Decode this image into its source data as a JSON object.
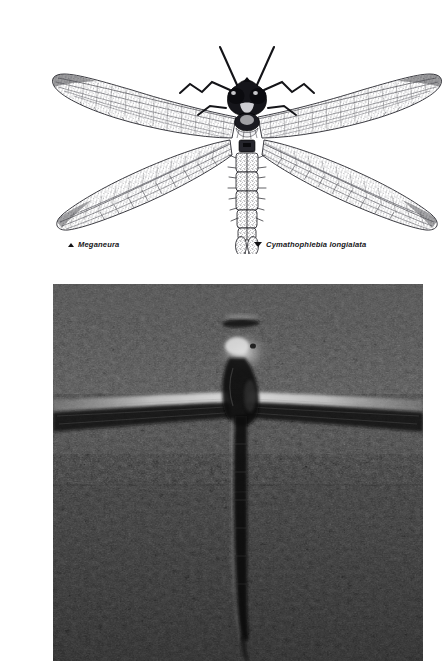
{
  "page": {
    "background_color": "#ffffff",
    "width": 413,
    "height": 662
  },
  "illustration": {
    "name": "giant-dragonfly-engraving",
    "subject": "Meganeura giant dragonfly, dorsal view, wings spread",
    "style": "black and white line engraving / stipple drawing",
    "ink_color": "#1a1a1a",
    "paper_color": "#ffffff",
    "alt": "Engraving of an extinct giant dragonfly seen from above with four long spread wings, large compound eyes, antennae and a segmented abdomen"
  },
  "captions": [
    {
      "marker": "triangle-up-icon",
      "marker_glyph": "▲",
      "text": "Meganeura"
    },
    {
      "marker": "triangle-down-icon",
      "marker_glyph": "▼",
      "text": "Cymathophlebia longialata"
    }
  ],
  "fossil_photo": {
    "name": "fossil-dragonfly-photograph",
    "subject": "Cymathophlebia longialata fossil impression in fine-grained limestone",
    "alt": "Grayscale photograph of a dragonfly fossil: a pale horizontal wing impression crosses the slab and a long dark abdomen runs downward from the thorax",
    "tone_dark": "#111111",
    "tone_mid": "#4a4a4a",
    "tone_light": "#c9c9c9",
    "border_color": "#000000"
  }
}
